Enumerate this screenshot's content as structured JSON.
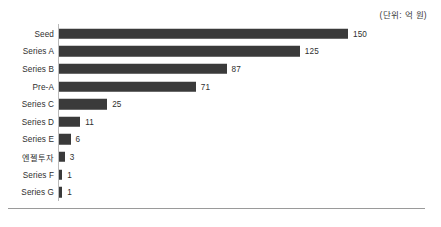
{
  "unit_caption": "(단위: 억 원)",
  "chart_data": {
    "type": "bar",
    "orientation": "horizontal",
    "title": "",
    "subtitle": "",
    "xlabel": "",
    "ylabel": "",
    "unit_note": "(단위: 억 원)",
    "grid": false,
    "legend": "none",
    "xlim": [
      0,
      150
    ],
    "categories": [
      "Seed",
      "Series A",
      "Series B",
      "Pre-A",
      "Series C",
      "Series D",
      "Series E",
      "엔젤투자",
      "Series F",
      "Series G"
    ],
    "values": [
      150,
      125,
      87,
      71,
      25,
      11,
      6,
      3,
      1,
      1
    ],
    "value_labels": [
      "150",
      "125",
      "87",
      "71",
      "25",
      "11",
      "6",
      "3",
      "1",
      "1"
    ],
    "bar_color": "#3a3a3a",
    "axis_color": "#b9b9b9",
    "text_color": "#2f2f2f"
  }
}
